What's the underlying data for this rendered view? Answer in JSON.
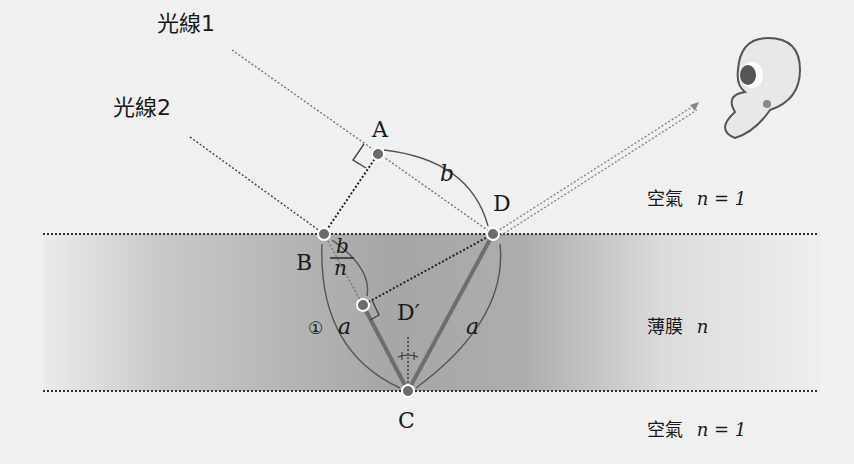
{
  "diagram": {
    "type": "thin-film-interference",
    "rays": {
      "ray1_label": "光線1",
      "ray2_label": "光線2"
    },
    "points": {
      "A": "A",
      "B": "B",
      "C": "C",
      "D": "D",
      "D_prime": "D′"
    },
    "lengths": {
      "b": "b",
      "b_over_n_num": "b",
      "b_over_n_den": "n",
      "a_left": "a",
      "a_right": "a"
    },
    "marker": "①",
    "media": {
      "top": "空氣",
      "top_n": "n = 1",
      "film": "薄膜",
      "film_n": "n",
      "bottom": "空氣",
      "bottom_n": "n = 1"
    },
    "colors": {
      "background": "#f0f0f0",
      "film_dark": "#a9a9a9",
      "film_light": "#ececec",
      "point_fill": "#6b6b6b",
      "line": "#555555",
      "thick_line": "#6e6e6e"
    }
  }
}
